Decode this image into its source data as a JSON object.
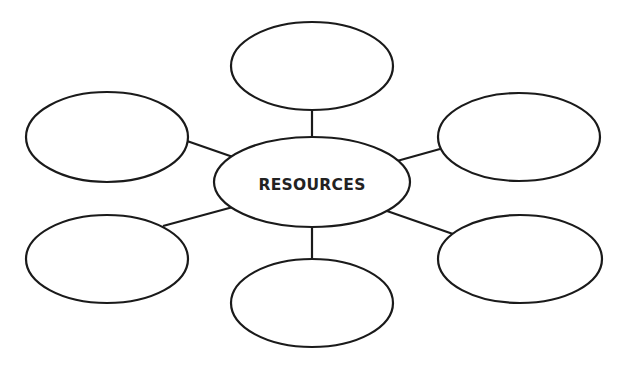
{
  "diagram": {
    "type": "mind-map",
    "center": {
      "label": "RESOURCES",
      "cx": 312,
      "cy": 182,
      "rx": 98,
      "ry": 45
    },
    "branches": [
      {
        "id": "top",
        "label": "",
        "cx": 312,
        "cy": 66,
        "rx": 81,
        "ry": 44
      },
      {
        "id": "top-left",
        "label": "",
        "cx": 107,
        "cy": 137,
        "rx": 81,
        "ry": 45
      },
      {
        "id": "top-right",
        "label": "",
        "cx": 519,
        "cy": 137,
        "rx": 81,
        "ry": 44
      },
      {
        "id": "bottom-left",
        "label": "",
        "cx": 107,
        "cy": 259,
        "rx": 81,
        "ry": 44
      },
      {
        "id": "bottom-right",
        "label": "",
        "cx": 520,
        "cy": 259,
        "rx": 82,
        "ry": 44
      },
      {
        "id": "bottom",
        "label": "",
        "cx": 312,
        "cy": 303,
        "rx": 81,
        "ry": 44
      }
    ],
    "edges": [
      {
        "from": "center",
        "to": "top"
      },
      {
        "from": "center",
        "to": "top-left"
      },
      {
        "from": "center",
        "to": "top-right"
      },
      {
        "from": "center",
        "to": "bottom-left"
      },
      {
        "from": "center",
        "to": "bottom-right"
      },
      {
        "from": "center",
        "to": "bottom"
      }
    ],
    "colors": {
      "stroke": "#1a1a1a",
      "fill": "#ffffff",
      "text": "#222222"
    }
  }
}
